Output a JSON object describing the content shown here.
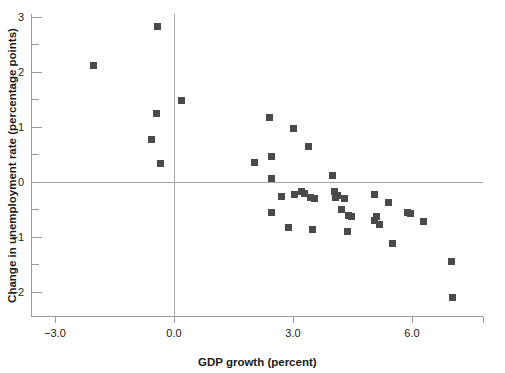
{
  "chart_data": {
    "type": "scatter",
    "title": "",
    "xlabel": "GDP growth (percent)",
    "ylabel": "Change in unemployment rate (percentage points)",
    "xlim": [
      -3.6,
      7.8
    ],
    "ylim": [
      -2.45,
      3.05
    ],
    "xticks": [
      -3.0,
      0.0,
      3.0,
      6.0
    ],
    "xtick_labels": [
      "−3.0",
      "0.0",
      "3.0",
      "6.0"
    ],
    "yticks": [
      -2,
      -1,
      0,
      1,
      2,
      3
    ],
    "ytick_labels": [
      "−2",
      "−1",
      "0",
      "1",
      "2",
      "3"
    ],
    "y_minor_ticks": [
      -1.5,
      -0.5,
      0.5,
      1.5,
      2.5
    ],
    "grid": false,
    "reference_lines": {
      "horizontal": 0.0,
      "vertical": 0.0
    },
    "legend": null,
    "marker": {
      "shape": "square",
      "size": 7,
      "color": "#4a4a4a"
    },
    "points": [
      {
        "x": -2.03,
        "y": 2.11
      },
      {
        "x": -0.42,
        "y": 2.83
      },
      {
        "x": -0.45,
        "y": 1.24
      },
      {
        "x": -0.57,
        "y": 0.78
      },
      {
        "x": -0.35,
        "y": 0.33
      },
      {
        "x": 0.18,
        "y": 1.49
      },
      {
        "x": 2.02,
        "y": 0.36
      },
      {
        "x": 2.42,
        "y": 1.17
      },
      {
        "x": 2.45,
        "y": 0.46
      },
      {
        "x": 2.45,
        "y": 0.06
      },
      {
        "x": 2.47,
        "y": -0.56
      },
      {
        "x": 2.72,
        "y": -0.27
      },
      {
        "x": 2.88,
        "y": -0.82
      },
      {
        "x": 3.02,
        "y": 0.97
      },
      {
        "x": 3.05,
        "y": -0.22
      },
      {
        "x": 3.22,
        "y": -0.18
      },
      {
        "x": 3.3,
        "y": -0.2
      },
      {
        "x": 3.38,
        "y": 0.65
      },
      {
        "x": 3.45,
        "y": -0.28
      },
      {
        "x": 3.55,
        "y": -0.3
      },
      {
        "x": 3.48,
        "y": -0.86
      },
      {
        "x": 4.0,
        "y": 0.12
      },
      {
        "x": 4.05,
        "y": -0.18
      },
      {
        "x": 4.08,
        "y": -0.28
      },
      {
        "x": 4.12,
        "y": -0.24
      },
      {
        "x": 4.3,
        "y": -0.3
      },
      {
        "x": 4.22,
        "y": -0.5
      },
      {
        "x": 4.4,
        "y": -0.6
      },
      {
        "x": 4.48,
        "y": -0.62
      },
      {
        "x": 4.38,
        "y": -0.9
      },
      {
        "x": 5.05,
        "y": -0.22
      },
      {
        "x": 5.05,
        "y": -0.7
      },
      {
        "x": 5.1,
        "y": -0.62
      },
      {
        "x": 5.42,
        "y": -0.38
      },
      {
        "x": 5.18,
        "y": -0.78
      },
      {
        "x": 5.52,
        "y": -1.12
      },
      {
        "x": 5.88,
        "y": -0.55
      },
      {
        "x": 5.95,
        "y": -0.57
      },
      {
        "x": 6.28,
        "y": -0.72
      },
      {
        "x": 7.0,
        "y": -1.45
      },
      {
        "x": 7.02,
        "y": -2.1
      }
    ]
  }
}
